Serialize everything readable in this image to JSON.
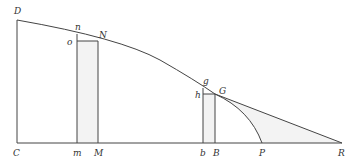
{
  "diagram": {
    "colors": {
      "line": "#444444",
      "label": "#333333",
      "shade": "#e9e9e9",
      "background": "#ffffff"
    },
    "labels": {
      "D": "D",
      "C": "C",
      "n": "n",
      "o": "o",
      "N": "N",
      "m": "m",
      "M": "M",
      "g": "g",
      "h": "h",
      "G": "G",
      "b": "b",
      "B": "B",
      "P": "P",
      "R": "R"
    },
    "points": {
      "D": [
        17,
        20
      ],
      "C": [
        17,
        143
      ],
      "n": [
        77,
        34
      ],
      "N": [
        98,
        41
      ],
      "o": [
        77,
        41
      ],
      "m": [
        77,
        143
      ],
      "M": [
        98,
        143
      ],
      "g": [
        203,
        88
      ],
      "G": [
        215,
        94
      ],
      "h": [
        203,
        94
      ],
      "b": [
        203,
        143
      ],
      "B": [
        215,
        143
      ],
      "P": [
        262,
        143
      ],
      "R": [
        342,
        143
      ]
    }
  }
}
